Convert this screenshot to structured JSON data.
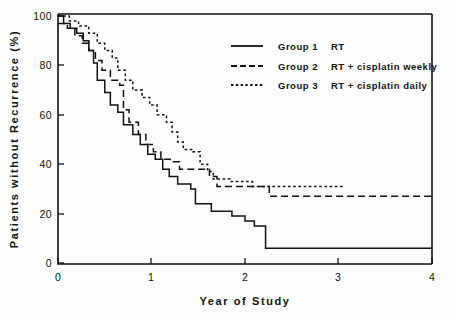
{
  "chart_data": {
    "type": "line",
    "subtype": "kaplan-meier-step",
    "title": "",
    "xlabel": "Year of Study",
    "ylabel": "Patients without Recurrence (%)",
    "xlim": [
      0,
      4
    ],
    "ylim": [
      0,
      100
    ],
    "xticks": [
      0,
      1,
      2,
      3,
      4
    ],
    "xtick_labels": [
      "0",
      "1",
      "2",
      "3",
      "4"
    ],
    "yticks": [
      0,
      20,
      40,
      60,
      80,
      100
    ],
    "ytick_labels": [
      "0",
      "20",
      "40",
      "60",
      "80",
      "100"
    ],
    "grid": false,
    "legend_position": "upper-right-inside",
    "series": [
      {
        "name": "Group 1",
        "label": "Group 1",
        "description": "RT",
        "linestyle": "solid",
        "color": "#111111",
        "points": [
          [
            0.0,
            100
          ],
          [
            0.06,
            100
          ],
          [
            0.06,
            97
          ],
          [
            0.13,
            97
          ],
          [
            0.13,
            95
          ],
          [
            0.2,
            95
          ],
          [
            0.2,
            93
          ],
          [
            0.27,
            93
          ],
          [
            0.27,
            90
          ],
          [
            0.33,
            90
          ],
          [
            0.33,
            86
          ],
          [
            0.38,
            86
          ],
          [
            0.38,
            81
          ],
          [
            0.42,
            81
          ],
          [
            0.42,
            74
          ],
          [
            0.5,
            74
          ],
          [
            0.5,
            69
          ],
          [
            0.56,
            69
          ],
          [
            0.56,
            64
          ],
          [
            0.64,
            64
          ],
          [
            0.64,
            61
          ],
          [
            0.7,
            61
          ],
          [
            0.7,
            56
          ],
          [
            0.8,
            56
          ],
          [
            0.8,
            52
          ],
          [
            0.88,
            52
          ],
          [
            0.88,
            48
          ],
          [
            0.96,
            48
          ],
          [
            0.96,
            44
          ],
          [
            1.04,
            44
          ],
          [
            1.04,
            42
          ],
          [
            1.12,
            42
          ],
          [
            1.12,
            38
          ],
          [
            1.19,
            38
          ],
          [
            1.19,
            35
          ],
          [
            1.28,
            35
          ],
          [
            1.28,
            32
          ],
          [
            1.42,
            32
          ],
          [
            1.42,
            30
          ],
          [
            1.47,
            30
          ],
          [
            1.47,
            24
          ],
          [
            1.64,
            24
          ],
          [
            1.64,
            21
          ],
          [
            1.86,
            21
          ],
          [
            1.86,
            19
          ],
          [
            2.0,
            19
          ],
          [
            2.0,
            17
          ],
          [
            2.1,
            17
          ],
          [
            2.1,
            15
          ],
          [
            2.22,
            15
          ],
          [
            2.22,
            6
          ],
          [
            4.0,
            6
          ]
        ]
      },
      {
        "name": "Group 2",
        "label": "Group 2",
        "description": "RT + cisplatin weekly",
        "linestyle": "dashed",
        "color": "#111111",
        "points": [
          [
            0.0,
            97
          ],
          [
            0.1,
            97
          ],
          [
            0.1,
            95
          ],
          [
            0.18,
            95
          ],
          [
            0.18,
            92
          ],
          [
            0.26,
            92
          ],
          [
            0.26,
            89
          ],
          [
            0.33,
            89
          ],
          [
            0.33,
            86
          ],
          [
            0.4,
            86
          ],
          [
            0.4,
            82
          ],
          [
            0.47,
            82
          ],
          [
            0.47,
            78
          ],
          [
            0.56,
            78
          ],
          [
            0.56,
            74
          ],
          [
            0.66,
            74
          ],
          [
            0.66,
            72
          ],
          [
            0.7,
            72
          ],
          [
            0.7,
            62
          ],
          [
            0.76,
            62
          ],
          [
            0.76,
            57
          ],
          [
            0.86,
            57
          ],
          [
            0.86,
            52
          ],
          [
            0.94,
            52
          ],
          [
            0.94,
            48
          ],
          [
            1.02,
            48
          ],
          [
            1.02,
            45
          ],
          [
            1.1,
            45
          ],
          [
            1.1,
            42
          ],
          [
            1.2,
            42
          ],
          [
            1.2,
            41
          ],
          [
            1.3,
            41
          ],
          [
            1.3,
            38
          ],
          [
            1.62,
            38
          ],
          [
            1.62,
            35
          ],
          [
            1.7,
            35
          ],
          [
            1.7,
            31
          ],
          [
            2.26,
            31
          ],
          [
            2.26,
            27
          ],
          [
            4.0,
            27
          ]
        ]
      },
      {
        "name": "Group 3",
        "label": "Group 3",
        "description": "RT + cisplatin daily",
        "linestyle": "dotted",
        "color": "#111111",
        "points": [
          [
            0.0,
            100
          ],
          [
            0.12,
            100
          ],
          [
            0.12,
            98
          ],
          [
            0.22,
            98
          ],
          [
            0.22,
            96
          ],
          [
            0.33,
            96
          ],
          [
            0.33,
            93
          ],
          [
            0.42,
            93
          ],
          [
            0.42,
            89
          ],
          [
            0.5,
            89
          ],
          [
            0.5,
            86
          ],
          [
            0.58,
            86
          ],
          [
            0.58,
            83
          ],
          [
            0.64,
            83
          ],
          [
            0.64,
            78
          ],
          [
            0.72,
            78
          ],
          [
            0.72,
            74
          ],
          [
            0.8,
            74
          ],
          [
            0.8,
            70
          ],
          [
            0.9,
            70
          ],
          [
            0.9,
            67
          ],
          [
            0.98,
            67
          ],
          [
            0.98,
            64
          ],
          [
            1.06,
            64
          ],
          [
            1.06,
            60
          ],
          [
            1.16,
            60
          ],
          [
            1.16,
            57
          ],
          [
            1.22,
            57
          ],
          [
            1.22,
            53
          ],
          [
            1.28,
            53
          ],
          [
            1.28,
            49
          ],
          [
            1.34,
            49
          ],
          [
            1.34,
            46
          ],
          [
            1.44,
            46
          ],
          [
            1.44,
            45
          ],
          [
            1.52,
            45
          ],
          [
            1.52,
            40
          ],
          [
            1.6,
            40
          ],
          [
            1.6,
            37
          ],
          [
            1.66,
            37
          ],
          [
            1.66,
            34
          ],
          [
            1.84,
            34
          ],
          [
            1.84,
            33
          ],
          [
            2.08,
            33
          ],
          [
            2.08,
            31
          ],
          [
            3.06,
            31
          ]
        ]
      }
    ]
  },
  "legend": {
    "entries": [
      {
        "swatch": "solid-line-swatch",
        "group": "Group 1",
        "treatment": "RT"
      },
      {
        "swatch": "dashed-line-swatch",
        "group": "Group 2",
        "treatment": "RT + cisplatin weekly"
      },
      {
        "swatch": "dotted-line-swatch",
        "group": "Group 3",
        "treatment": "RT + cisplatin daily"
      }
    ]
  },
  "colors": {
    "ink": "#111111",
    "background": "#fdfdfd"
  }
}
